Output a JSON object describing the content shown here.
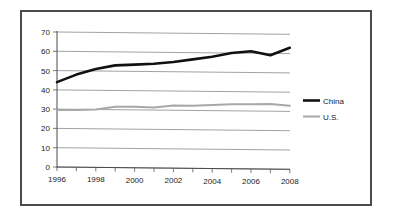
{
  "chart_data": {
    "type": "line",
    "title": "",
    "subtitle": "",
    "xlabel": "",
    "ylabel": "",
    "x": [
      1996,
      1997,
      1998,
      1999,
      2000,
      2001,
      2002,
      2003,
      2004,
      2005,
      2006,
      2007,
      2008
    ],
    "xlim": [
      1996,
      2008
    ],
    "ylim": [
      0,
      70
    ],
    "yticks": [
      0,
      10,
      20,
      30,
      40,
      50,
      60,
      70
    ],
    "ytick_labels": [
      "0",
      "10",
      "20",
      "30",
      "40",
      "50",
      "60",
      "70"
    ],
    "xticks": [
      1996,
      1997,
      1998,
      1999,
      2000,
      2001,
      2002,
      2003,
      2004,
      2005,
      2006,
      2007,
      2008
    ],
    "xtick_labels": [
      "1996",
      "",
      "1998",
      "",
      "2000",
      "",
      "2002",
      "",
      "2004",
      "",
      "2006",
      "",
      "2008"
    ],
    "xtick_labels_shown": [
      "1996",
      "1998",
      "2000",
      "2002",
      "2004",
      "2006",
      "2008"
    ],
    "grid": "horizontal",
    "legend_position": "right",
    "series": [
      {
        "name": "China",
        "color": "#111111",
        "style": "thick-black-line",
        "values": [
          44,
          48,
          51,
          53,
          53.5,
          54,
          55,
          56.5,
          58,
          60,
          61,
          59,
          63
        ]
      },
      {
        "name": "U.S.",
        "color": "#a8a8a8",
        "style": "thin-gray-line",
        "values": [
          29.5,
          29.6,
          30,
          31.5,
          31.7,
          31.3,
          32.5,
          32.5,
          33,
          33.4,
          33.5,
          33.8,
          33
        ]
      }
    ]
  },
  "legend": {
    "entries": [
      {
        "label": "China",
        "color": "#111111"
      },
      {
        "label": "U.S.",
        "color": "#a8a8a8"
      }
    ]
  },
  "axes": {
    "y_tick_labels": [
      "70",
      "60",
      "50",
      "40",
      "30",
      "20",
      "10",
      "0"
    ],
    "x_tick_labels": [
      "1996",
      "1998",
      "2000",
      "2002",
      "2004",
      "2006",
      "2008"
    ]
  },
  "colors": {
    "china_line": "#111111",
    "us_line": "#a8a8a8",
    "gridline": "#8a8a8a",
    "axis": "#4a4a4a",
    "frame": "#4b4b4b",
    "background": "#ffffff",
    "text": "#1a1a1a"
  }
}
